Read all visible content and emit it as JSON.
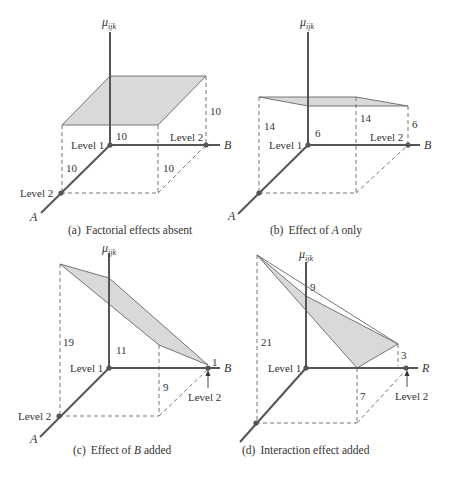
{
  "axis_labels": {
    "vertical": "μ",
    "vertical_sub": "ijk",
    "factor_a": "A",
    "factor_b": "B",
    "factor_b_alt": "R"
  },
  "level_labels": {
    "level1": "Level 1",
    "level2": "Level 2"
  },
  "panels": [
    {
      "id": "a",
      "caption_prefix": "(a)",
      "caption": "Factorial effects absent",
      "values": {
        "A1B1": "10",
        "A1B2": "10",
        "A2B1": "10",
        "A2B2": "10"
      }
    },
    {
      "id": "b",
      "caption_prefix": "(b)",
      "caption_pre": "Effect of ",
      "caption_var": "A",
      "caption_post": " only",
      "values": {
        "A1B1": "6",
        "A1B2": "6",
        "A2B1": "14",
        "A2B2": "14"
      }
    },
    {
      "id": "c",
      "caption_prefix": "(c)",
      "caption_pre": "Effect of ",
      "caption_var": "B",
      "caption_post": " added",
      "values": {
        "A1B1": "11",
        "A1B2": "1",
        "A2B1": "19",
        "A2B2": "9"
      }
    },
    {
      "id": "d",
      "caption_prefix": "(d)",
      "caption": "Interaction effect added",
      "values": {
        "A1B1": "9",
        "A1B2": "3",
        "A2B1": "21",
        "A2B2": "7"
      }
    }
  ],
  "colors": {
    "plane_fill": "#d9d9d9",
    "axis": "#555555",
    "background": "#ffffff"
  }
}
